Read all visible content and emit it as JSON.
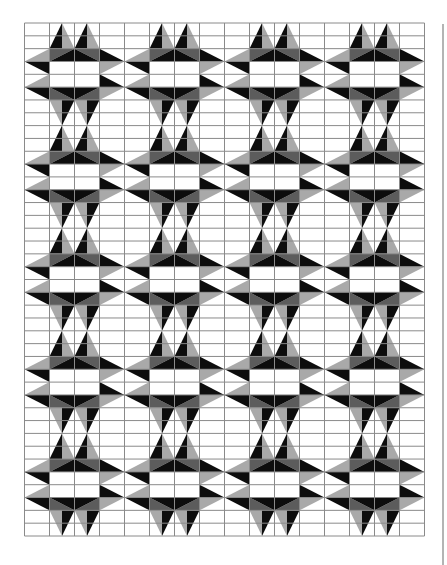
{
  "quilt": {
    "title": "",
    "grid": {
      "x0": 24.5,
      "y0": 23,
      "cols": 16,
      "rows": 40,
      "col_width": 25,
      "row_height": 12.825,
      "line_color": "#8a8a8a"
    },
    "block": {
      "cols": 4,
      "rows": 8,
      "repeat_x": 4,
      "repeat_y": 5
    },
    "colors": {
      "black": "#0d0d0d",
      "dark_gray": "#5c5c5c",
      "light_gray": "#a9a9a9",
      "white": "#ffffff"
    },
    "block_shapes": [
      {
        "name": "top-spike-1-left",
        "fill": "black",
        "pts": [
          [
            1.5,
            0
          ],
          [
            1,
            2
          ],
          [
            1.5,
            2
          ]
        ]
      },
      {
        "name": "top-spike-1-right",
        "fill": "light_gray",
        "pts": [
          [
            1.5,
            0
          ],
          [
            1.5,
            2
          ],
          [
            2,
            2
          ]
        ]
      },
      {
        "name": "top-spike-2-left",
        "fill": "black",
        "pts": [
          [
            2.5,
            0
          ],
          [
            2,
            2
          ],
          [
            2.5,
            2
          ]
        ]
      },
      {
        "name": "top-spike-2-right",
        "fill": "light_gray",
        "pts": [
          [
            2.5,
            0
          ],
          [
            2.5,
            2
          ],
          [
            3,
            2
          ]
        ]
      },
      {
        "name": "upper-band-left",
        "fill": "dark_gray",
        "pts": [
          [
            1,
            2
          ],
          [
            2,
            2
          ],
          [
            1,
            3
          ]
        ]
      },
      {
        "name": "upper-band-right",
        "fill": "dark_gray",
        "pts": [
          [
            2,
            2
          ],
          [
            3,
            2
          ],
          [
            3,
            3
          ]
        ]
      },
      {
        "name": "upper-band-center",
        "fill": "black",
        "pts": [
          [
            2,
            2
          ],
          [
            1,
            3
          ],
          [
            3,
            3
          ]
        ]
      },
      {
        "name": "lower-band-left",
        "fill": "dark_gray",
        "pts": [
          [
            1,
            5
          ],
          [
            1,
            6
          ],
          [
            2,
            6
          ]
        ]
      },
      {
        "name": "lower-band-right",
        "fill": "dark_gray",
        "pts": [
          [
            3,
            5
          ],
          [
            3,
            6
          ],
          [
            2,
            6
          ]
        ]
      },
      {
        "name": "lower-band-center",
        "fill": "black",
        "pts": [
          [
            1,
            5
          ],
          [
            3,
            5
          ],
          [
            2,
            6
          ]
        ]
      },
      {
        "name": "bottom-spike-1-left",
        "fill": "light_gray",
        "pts": [
          [
            1,
            6
          ],
          [
            1.5,
            6
          ],
          [
            1.5,
            8
          ]
        ]
      },
      {
        "name": "bottom-spike-1-right",
        "fill": "black",
        "pts": [
          [
            1.5,
            6
          ],
          [
            2,
            6
          ],
          [
            1.5,
            8
          ]
        ]
      },
      {
        "name": "bottom-spike-2-left",
        "fill": "light_gray",
        "pts": [
          [
            2,
            6
          ],
          [
            2.5,
            6
          ],
          [
            2.5,
            8
          ]
        ]
      },
      {
        "name": "bottom-spike-2-right",
        "fill": "black",
        "pts": [
          [
            2.5,
            6
          ],
          [
            3,
            6
          ],
          [
            2.5,
            8
          ]
        ]
      },
      {
        "name": "left-spike-1-top",
        "fill": "light_gray",
        "pts": [
          [
            0,
            3
          ],
          [
            1,
            2
          ],
          [
            1,
            3
          ]
        ]
      },
      {
        "name": "left-spike-1-bottom",
        "fill": "black",
        "pts": [
          [
            0,
            3
          ],
          [
            1,
            3
          ],
          [
            1,
            4
          ]
        ]
      },
      {
        "name": "left-spike-2-top",
        "fill": "light_gray",
        "pts": [
          [
            0,
            5
          ],
          [
            1,
            4
          ],
          [
            1,
            5
          ]
        ]
      },
      {
        "name": "left-spike-2-bottom",
        "fill": "black",
        "pts": [
          [
            0,
            5
          ],
          [
            1,
            5
          ],
          [
            1,
            6
          ]
        ]
      },
      {
        "name": "right-spike-1-top",
        "fill": "black",
        "pts": [
          [
            3,
            2
          ],
          [
            3,
            3
          ],
          [
            4,
            3
          ]
        ]
      },
      {
        "name": "right-spike-1-bottom",
        "fill": "light_gray",
        "pts": [
          [
            3,
            3
          ],
          [
            4,
            3
          ],
          [
            3,
            4
          ]
        ]
      },
      {
        "name": "right-spike-2-top",
        "fill": "black",
        "pts": [
          [
            3,
            4
          ],
          [
            3,
            5
          ],
          [
            4,
            5
          ]
        ]
      },
      {
        "name": "right-spike-2-bottom",
        "fill": "light_gray",
        "pts": [
          [
            3,
            5
          ],
          [
            4,
            5
          ],
          [
            3,
            6
          ]
        ]
      }
    ]
  }
}
